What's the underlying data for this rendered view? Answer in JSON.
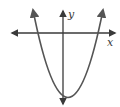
{
  "diagram": {
    "type": "parabola-graph",
    "axes": {
      "x_label": "x",
      "y_label": "y",
      "color": "#3a3a3a"
    },
    "curve": {
      "description": "upward-opening parabola, vertex below the x-axis slightly right of the y-axis",
      "color": "#555555"
    }
  }
}
